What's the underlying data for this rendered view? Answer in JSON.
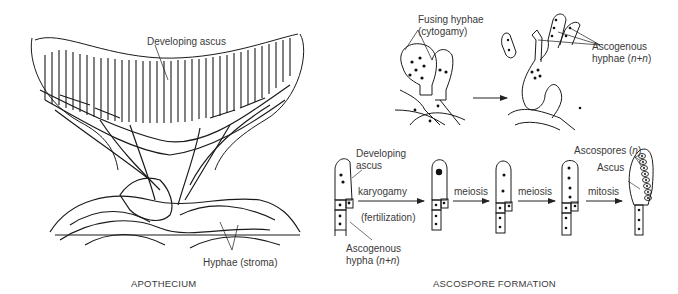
{
  "apothecium": {
    "caption": "APOTHECIUM",
    "labels": {
      "developing_ascus": "Developing ascus",
      "hyphae_stroma": "Hyphae (stroma)"
    }
  },
  "cytogamy": {
    "labels": {
      "fusing_hyphae_line1": "Fusing hyphae",
      "fusing_hyphae_line2": "(cytogamy)",
      "ascogenous_hyphae_line1": "Ascogenous",
      "ascogenous_hyphae_line2_prefix": "hyphae (",
      "ascogenous_hyphae_line2_formula": "n+n",
      "ascogenous_hyphae_line2_suffix": ")"
    }
  },
  "ascospore_formation": {
    "caption": "ASCOSPORE FORMATION",
    "labels": {
      "developing_ascus_line1": "Developing",
      "developing_ascus_line2": "ascus",
      "ascogenous_hypha_line1": "Ascogenous",
      "ascogenous_hypha_line2_prefix": "hypha (",
      "ascogenous_hypha_line2_formula": "n+n",
      "ascogenous_hypha_line2_suffix": ")",
      "ascospores_prefix": "Ascospores (",
      "ascospores_formula": "n",
      "ascospores_suffix": ")",
      "ascus": "Ascus"
    },
    "steps": [
      {
        "label": "karyogamy",
        "sublabel": "(fertilization)"
      },
      {
        "label": "meiosis",
        "sublabel": ""
      },
      {
        "label": "meiosis",
        "sublabel": ""
      },
      {
        "label": "mitosis",
        "sublabel": ""
      }
    ]
  }
}
